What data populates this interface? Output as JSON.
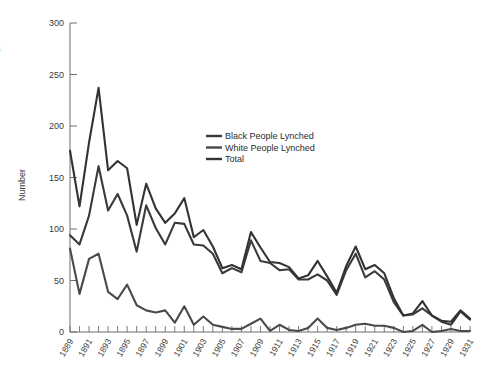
{
  "chart_data": {
    "type": "line",
    "title": "",
    "xlabel": "",
    "ylabel": "Number",
    "ylim": [
      0,
      300
    ],
    "yticks": [
      0,
      50,
      100,
      150,
      200,
      250,
      300
    ],
    "grid": false,
    "legend_position": "inside-upper-right",
    "x": [
      1889,
      1890,
      1891,
      1892,
      1893,
      1894,
      1895,
      1896,
      1897,
      1898,
      1899,
      1900,
      1901,
      1902,
      1903,
      1904,
      1905,
      1906,
      1907,
      1908,
      1909,
      1910,
      1911,
      1912,
      1913,
      1914,
      1915,
      1916,
      1917,
      1918,
      1919,
      1920,
      1921,
      1922,
      1923,
      1924,
      1925,
      1926,
      1927,
      1928,
      1929,
      1930,
      1931
    ],
    "xtick_labels": [
      "1889",
      "1891",
      "1893",
      "1895",
      "1897",
      "1899",
      "1901",
      "1903",
      "1905",
      "1907",
      "1909",
      "1911",
      "1913",
      "1915",
      "1917",
      "1919",
      "1921",
      "1923",
      "1925",
      "1927",
      "1929",
      "1931"
    ],
    "series": [
      {
        "name": "Black People Lynched",
        "color": "#3a3a3a",
        "values": [
          94,
          85,
          113,
          161,
          118,
          134,
          113,
          78,
          123,
          101,
          85,
          106,
          105,
          85,
          84,
          76,
          57,
          62,
          58,
          89,
          69,
          67,
          60,
          61,
          51,
          51,
          56,
          50,
          36,
          60,
          76,
          53,
          59,
          51,
          29,
          16,
          17,
          23,
          16,
          10,
          7,
          20,
          12
        ],
        "points": [
          {
            "x": 1889,
            "y": 94
          },
          {
            "x": 1890,
            "y": 85
          },
          {
            "x": 1891,
            "y": 113
          },
          {
            "x": 1892,
            "y": 161
          },
          {
            "x": 1893,
            "y": 118
          },
          {
            "x": 1894,
            "y": 134
          },
          {
            "x": 1895,
            "y": 113
          },
          {
            "x": 1896,
            "y": 78
          },
          {
            "x": 1897,
            "y": 123
          },
          {
            "x": 1898,
            "y": 101
          },
          {
            "x": 1899,
            "y": 85
          },
          {
            "x": 1900,
            "y": 106
          },
          {
            "x": 1901,
            "y": 105
          },
          {
            "x": 1902,
            "y": 85
          },
          {
            "x": 1903,
            "y": 84
          },
          {
            "x": 1904,
            "y": 76
          },
          {
            "x": 1905,
            "y": 57
          },
          {
            "x": 1906,
            "y": 62
          },
          {
            "x": 1907,
            "y": 58
          },
          {
            "x": 1908,
            "y": 89
          },
          {
            "x": 1909,
            "y": 69
          },
          {
            "x": 1910,
            "y": 67
          },
          {
            "x": 1911,
            "y": 60
          },
          {
            "x": 1912,
            "y": 61
          },
          {
            "x": 1913,
            "y": 51
          },
          {
            "x": 1914,
            "y": 51
          },
          {
            "x": 1915,
            "y": 56
          },
          {
            "x": 1916,
            "y": 50
          },
          {
            "x": 1917,
            "y": 36
          },
          {
            "x": 1918,
            "y": 60
          },
          {
            "x": 1919,
            "y": 76
          },
          {
            "x": 1920,
            "y": 53
          },
          {
            "x": 1921,
            "y": 59
          },
          {
            "x": 1922,
            "y": 51
          },
          {
            "x": 1923,
            "y": 29
          },
          {
            "x": 1924,
            "y": 16
          },
          {
            "x": 1925,
            "y": 17
          },
          {
            "x": 1926,
            "y": 23
          },
          {
            "x": 1927,
            "y": 16
          },
          {
            "x": 1928,
            "y": 10
          },
          {
            "x": 1929,
            "y": 7
          },
          {
            "x": 1930,
            "y": 20
          },
          {
            "x": 1931,
            "y": 12
          }
        ]
      },
      {
        "name": "White People Lynched",
        "color": "#4a4a4a",
        "values": [
          81,
          37,
          71,
          76,
          39,
          32,
          46,
          26,
          21,
          19,
          21,
          9,
          25,
          7,
          15,
          7,
          5,
          3,
          3,
          8,
          13,
          1,
          7,
          2,
          1,
          4,
          13,
          4,
          2,
          4,
          7,
          8,
          6,
          6,
          4,
          0,
          1,
          7,
          0,
          1,
          3,
          1,
          1
        ],
        "points": [
          {
            "x": 1889,
            "y": 81
          },
          {
            "x": 1890,
            "y": 37
          },
          {
            "x": 1891,
            "y": 71
          },
          {
            "x": 1892,
            "y": 76
          },
          {
            "x": 1893,
            "y": 39
          },
          {
            "x": 1894,
            "y": 32
          },
          {
            "x": 1895,
            "y": 46
          },
          {
            "x": 1896,
            "y": 26
          },
          {
            "x": 1897,
            "y": 21
          },
          {
            "x": 1898,
            "y": 19
          },
          {
            "x": 1899,
            "y": 21
          },
          {
            "x": 1900,
            "y": 9
          },
          {
            "x": 1901,
            "y": 25
          },
          {
            "x": 1902,
            "y": 7
          },
          {
            "x": 1903,
            "y": 15
          },
          {
            "x": 1904,
            "y": 7
          },
          {
            "x": 1905,
            "y": 5
          },
          {
            "x": 1906,
            "y": 3
          },
          {
            "x": 1907,
            "y": 3
          },
          {
            "x": 1908,
            "y": 8
          },
          {
            "x": 1909,
            "y": 13
          },
          {
            "x": 1910,
            "y": 1
          },
          {
            "x": 1911,
            "y": 7
          },
          {
            "x": 1912,
            "y": 2
          },
          {
            "x": 1913,
            "y": 1
          },
          {
            "x": 1914,
            "y": 4
          },
          {
            "x": 1915,
            "y": 13
          },
          {
            "x": 1916,
            "y": 4
          },
          {
            "x": 1917,
            "y": 2
          },
          {
            "x": 1918,
            "y": 4
          },
          {
            "x": 1919,
            "y": 7
          },
          {
            "x": 1920,
            "y": 8
          },
          {
            "x": 1921,
            "y": 6
          },
          {
            "x": 1922,
            "y": 6
          },
          {
            "x": 1923,
            "y": 4
          },
          {
            "x": 1924,
            "y": 0
          },
          {
            "x": 1925,
            "y": 1
          },
          {
            "x": 1926,
            "y": 7
          },
          {
            "x": 1927,
            "y": 0
          },
          {
            "x": 1928,
            "y": 1
          },
          {
            "x": 1929,
            "y": 3
          },
          {
            "x": 1930,
            "y": 1
          },
          {
            "x": 1931,
            "y": 1
          }
        ]
      },
      {
        "name": "Total",
        "color": "#333333",
        "values": [
          176,
          122,
          184,
          237,
          157,
          166,
          159,
          104,
          144,
          120,
          106,
          115,
          130,
          92,
          99,
          83,
          62,
          65,
          61,
          97,
          82,
          68,
          67,
          63,
          52,
          55,
          69,
          54,
          38,
          64,
          83,
          61,
          65,
          57,
          33,
          16,
          18,
          30,
          16,
          11,
          10,
          21,
          13
        ],
        "points": [
          {
            "x": 1889,
            "y": 176
          },
          {
            "x": 1890,
            "y": 122
          },
          {
            "x": 1891,
            "y": 184
          },
          {
            "x": 1892,
            "y": 237
          },
          {
            "x": 1893,
            "y": 157
          },
          {
            "x": 1894,
            "y": 166
          },
          {
            "x": 1895,
            "y": 159
          },
          {
            "x": 1896,
            "y": 104
          },
          {
            "x": 1897,
            "y": 144
          },
          {
            "x": 1898,
            "y": 120
          },
          {
            "x": 1899,
            "y": 106
          },
          {
            "x": 1900,
            "y": 115
          },
          {
            "x": 1901,
            "y": 130
          },
          {
            "x": 1902,
            "y": 92
          },
          {
            "x": 1903,
            "y": 99
          },
          {
            "x": 1904,
            "y": 83
          },
          {
            "x": 1905,
            "y": 62
          },
          {
            "x": 1906,
            "y": 65
          },
          {
            "x": 1907,
            "y": 61
          },
          {
            "x": 1908,
            "y": 97
          },
          {
            "x": 1909,
            "y": 82
          },
          {
            "x": 1910,
            "y": 68
          },
          {
            "x": 1911,
            "y": 67
          },
          {
            "x": 1912,
            "y": 63
          },
          {
            "x": 1913,
            "y": 52
          },
          {
            "x": 1914,
            "y": 55
          },
          {
            "x": 1915,
            "y": 69
          },
          {
            "x": 1916,
            "y": 54
          },
          {
            "x": 1917,
            "y": 38
          },
          {
            "x": 1918,
            "y": 64
          },
          {
            "x": 1919,
            "y": 83
          },
          {
            "x": 1920,
            "y": 61
          },
          {
            "x": 1921,
            "y": 65
          },
          {
            "x": 1922,
            "y": 57
          },
          {
            "x": 1923,
            "y": 33
          },
          {
            "x": 1924,
            "y": 16
          },
          {
            "x": 1925,
            "y": 18
          },
          {
            "x": 1926,
            "y": 30
          },
          {
            "x": 1927,
            "y": 16
          },
          {
            "x": 1928,
            "y": 11
          },
          {
            "x": 1929,
            "y": 10
          },
          {
            "x": 1930,
            "y": 21
          },
          {
            "x": 1931,
            "y": 13
          }
        ]
      }
    ]
  },
  "axes": {
    "y_title": "Number",
    "y_tick_labels": [
      "300",
      "250",
      "200",
      "150",
      "100",
      "50",
      "0"
    ]
  },
  "legend": {
    "entries": [
      {
        "label": "Black People Lynched"
      },
      {
        "label": "White People Lynched"
      },
      {
        "label": "Total"
      }
    ]
  },
  "edge_fragment": {
    "text": "s"
  },
  "colors": {
    "background": "#ffffff",
    "axis": "#6e6e6e",
    "line_black_series": "#3a3a3a",
    "line_white_series": "#4a4a4a",
    "line_total": "#333333",
    "text": "#3a3a3a"
  }
}
